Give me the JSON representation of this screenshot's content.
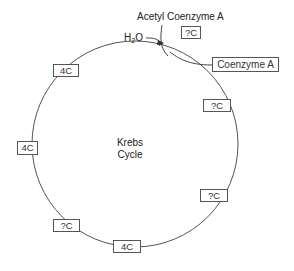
{
  "diagram": {
    "title": "Krebs Cycle",
    "center_label": {
      "line1": "Krebs",
      "line2": "Cycle"
    },
    "inputs": {
      "acetyl_coa": {
        "label": "Acetyl Coenzyme A",
        "carbon": "?C"
      },
      "water": {
        "label_main": "H",
        "label_sub": "2",
        "label_end": "O"
      }
    },
    "outputs": {
      "coenzyme_a": {
        "label": "Coenzyme A"
      }
    },
    "intermediates": [
      {
        "id": "right-upper",
        "label": "?C"
      },
      {
        "id": "right-lower",
        "label": "?C"
      },
      {
        "id": "bottom",
        "label": "4C"
      },
      {
        "id": "lower-left",
        "label": "?C"
      },
      {
        "id": "left",
        "label": "4C"
      },
      {
        "id": "upper-left",
        "label": "4C"
      }
    ],
    "colors": {
      "line": "#555555",
      "text": "#222222",
      "background": "#ffffff"
    }
  }
}
